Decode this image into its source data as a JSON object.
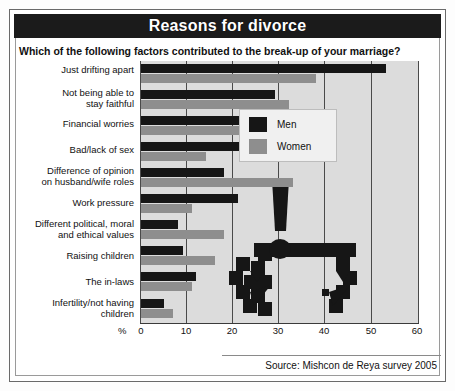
{
  "header": {
    "title": "Reasons for divorce",
    "subtitle": "Which of the following factors contributed to the break-up of your marriage?"
  },
  "legend": {
    "men_label": "Men",
    "women_label": "Women"
  },
  "axis": {
    "percent_symbol": "%",
    "ticks": [
      "0",
      "10",
      "20",
      "30",
      "40",
      "50",
      "60"
    ]
  },
  "footer": {
    "source": "Source: Mishcon de Reya survey 2005"
  },
  "colors": {
    "men": "#161616",
    "women": "#8e8e8e",
    "plot_background": "#dcdcdc",
    "title_background": "#1b1b1b",
    "title_text": "#ffffff"
  },
  "chart_data": {
    "type": "bar",
    "orientation": "horizontal",
    "title": "Reasons for divorce",
    "subtitle": "Which of the following factors contributed to the break-up of your marriage?",
    "xlabel": "%",
    "ylabel": "",
    "xlim": [
      0,
      60
    ],
    "xticks": [
      0,
      10,
      20,
      30,
      40,
      50,
      60
    ],
    "grid": true,
    "legend_position": "upper-right-inside",
    "categories": [
      "Just drifting apart",
      "Not being able to\nstay faithful",
      "Financial worries",
      "Bad/lack of sex",
      "Difference of opinion\non husband/wife roles",
      "Work pressure",
      "Different political, moral\nand ethical values",
      "Raising children",
      "The in-laws",
      "Infertility/not having\nchildren"
    ],
    "series": [
      {
        "name": "Men",
        "color": "#161616",
        "values": [
          53,
          29,
          29,
          23,
          18,
          21,
          8,
          9,
          12,
          5
        ]
      },
      {
        "name": "Women",
        "color": "#8e8e8e",
        "values": [
          38,
          32,
          26,
          14,
          33,
          11,
          18,
          16,
          11,
          7
        ]
      }
    ],
    "annotations": [
      "Source: Mishcon de Reya survey 2005"
    ]
  }
}
